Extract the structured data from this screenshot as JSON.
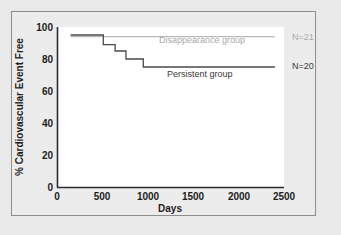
{
  "figure": {
    "background_color": "#e9e9e9",
    "panel_color": "#ececec",
    "plot_color": "#ffffff",
    "frame_color": "#8d8d8d"
  },
  "chart_data": {
    "type": "line",
    "subtype": "kaplan-meier-step",
    "title": "",
    "xlabel": "Days",
    "ylabel": "% Cardiovascular Event Free",
    "xlim": [
      0,
      2500
    ],
    "ylim": [
      0,
      100
    ],
    "xticks": [
      0,
      500,
      1000,
      1500,
      2000,
      2500
    ],
    "yticks": [
      0,
      20,
      40,
      60,
      80,
      100
    ],
    "xtick_labels": [
      "0",
      "500",
      "1000",
      "1500",
      "2000",
      "2500"
    ],
    "ytick_labels": [
      "0",
      "20",
      "40",
      "60",
      "80",
      "100"
    ],
    "grid": false,
    "legend_position": "inline-annotation",
    "series": [
      {
        "name": "Disappearance group",
        "label": "Disappearance group",
        "n_label": "N=21",
        "n": 21,
        "color": "#b9b9b9",
        "line_width": 1.2,
        "x": [
          150,
          2400
        ],
        "y": [
          94,
          94
        ],
        "label_x": 1130,
        "label_y": 89
      },
      {
        "name": "Persistent group",
        "label": "Persistent group",
        "n_label": "N=20",
        "n": 20,
        "color": "#4a4a4a",
        "line_width": 1.3,
        "x": [
          150,
          510,
          510,
          640,
          640,
          760,
          760,
          950,
          950,
          2400
        ],
        "y": [
          95,
          95,
          89,
          89,
          85,
          85,
          80,
          80,
          75,
          75
        ],
        "label_x": 1170,
        "label_y": 67
      }
    ],
    "annotations": [
      {
        "text": "Disappearance group",
        "color": "#b9b9b9"
      },
      {
        "text": "Persistent group",
        "color": "#3a3a3a"
      },
      {
        "text": "N=21",
        "color": "#a8a8a8"
      },
      {
        "text": "N=20",
        "color": "#3a3a3a"
      }
    ]
  },
  "axes": {
    "x_title": "Days",
    "y_title": "% Cardiovascular Event Free",
    "x_ticks": [
      {
        "value": "0"
      },
      {
        "value": "500"
      },
      {
        "value": "1000"
      },
      {
        "value": "1500"
      },
      {
        "value": "2000"
      },
      {
        "value": "2500"
      }
    ],
    "y_ticks": [
      {
        "value": "100"
      },
      {
        "value": "80"
      },
      {
        "value": "60"
      },
      {
        "value": "40"
      },
      {
        "value": "20"
      },
      {
        "value": "0"
      }
    ]
  },
  "labels": {
    "disappearance_group": "Disappearance group",
    "persistent_group": "Persistent group",
    "n_disappearance": "N=21",
    "n_persistent": "N=20"
  }
}
